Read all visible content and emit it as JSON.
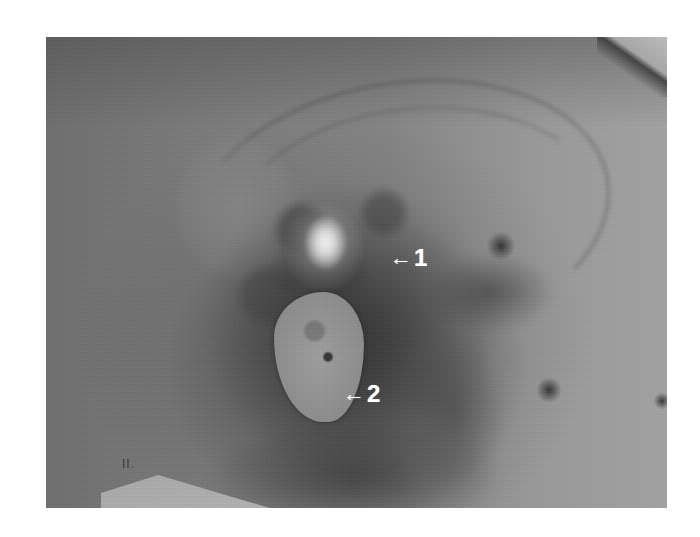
{
  "figure": {
    "annotations": [
      {
        "id": "1",
        "arrow": "←",
        "label": "1"
      },
      {
        "id": "2",
        "arrow": "←",
        "label": "2"
      }
    ],
    "paper_mark": "II."
  },
  "colors": {
    "background": "#ffffff",
    "photo_midtone": "#8a8a8a",
    "annotation_text": "#ffffff"
  }
}
